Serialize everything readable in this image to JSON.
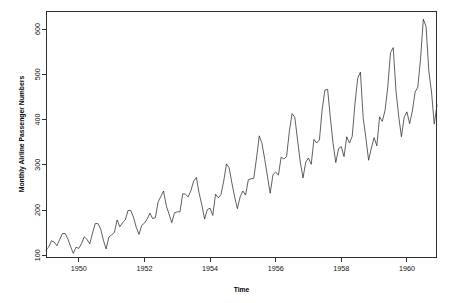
{
  "figure": {
    "background_color": "#ffffff",
    "foreground_color": "#1a1a1a",
    "line_color": "#2b2b2b",
    "width": 453,
    "height": 303
  },
  "axes": {
    "y_axis_title": "Monthly Airline Passenger Numbers",
    "x_axis_title": "Time",
    "y_ticks": [
      "100",
      "200",
      "300",
      "400",
      "500",
      "600"
    ],
    "x_ticks": [
      "1950",
      "1952",
      "1954",
      "1956",
      "1958",
      "1960"
    ]
  },
  "chart_data": {
    "type": "line",
    "title": "",
    "subtitle": "",
    "xlabel": "Time",
    "ylabel": "Monthly Airline Passenger Numbers",
    "xlim": [
      1949.0,
      1960.917
    ],
    "ylim": [
      95,
      640
    ],
    "xticks": [
      1950,
      1952,
      1954,
      1956,
      1958,
      1960
    ],
    "xticklabels": [
      "1950",
      "1952",
      "1954",
      "1956",
      "1958",
      "1960"
    ],
    "yticks": [
      100,
      200,
      300,
      400,
      500,
      600
    ],
    "yticklabels": [
      "100",
      "200",
      "300",
      "400",
      "500",
      "600"
    ],
    "grid": false,
    "legend": false,
    "legend_position": "none",
    "series": [
      {
        "name": "AirPassengers",
        "x": [
          1949.0,
          1949.083,
          1949.167,
          1949.25,
          1949.333,
          1949.417,
          1949.5,
          1949.583,
          1949.667,
          1949.75,
          1949.833,
          1949.917,
          1950.0,
          1950.083,
          1950.167,
          1950.25,
          1950.333,
          1950.417,
          1950.5,
          1950.583,
          1950.667,
          1950.75,
          1950.833,
          1950.917,
          1951.0,
          1951.083,
          1951.167,
          1951.25,
          1951.333,
          1951.417,
          1951.5,
          1951.583,
          1951.667,
          1951.75,
          1951.833,
          1951.917,
          1952.0,
          1952.083,
          1952.167,
          1952.25,
          1952.333,
          1952.417,
          1952.5,
          1952.583,
          1952.667,
          1952.75,
          1952.833,
          1952.917,
          1953.0,
          1953.083,
          1953.167,
          1953.25,
          1953.333,
          1953.417,
          1953.5,
          1953.583,
          1953.667,
          1953.75,
          1953.833,
          1953.917,
          1954.0,
          1954.083,
          1954.167,
          1954.25,
          1954.333,
          1954.417,
          1954.5,
          1954.583,
          1954.667,
          1954.75,
          1954.833,
          1954.917,
          1955.0,
          1955.083,
          1955.167,
          1955.25,
          1955.333,
          1955.417,
          1955.5,
          1955.583,
          1955.667,
          1955.75,
          1955.833,
          1955.917,
          1956.0,
          1956.083,
          1956.167,
          1956.25,
          1956.333,
          1956.417,
          1956.5,
          1956.583,
          1956.667,
          1956.75,
          1956.833,
          1956.917,
          1957.0,
          1957.083,
          1957.167,
          1957.25,
          1957.333,
          1957.417,
          1957.5,
          1957.583,
          1957.667,
          1957.75,
          1957.833,
          1957.917,
          1958.0,
          1958.083,
          1958.167,
          1958.25,
          1958.333,
          1958.417,
          1958.5,
          1958.583,
          1958.667,
          1958.75,
          1958.833,
          1958.917,
          1959.0,
          1959.083,
          1959.167,
          1959.25,
          1959.333,
          1959.417,
          1959.5,
          1959.583,
          1959.667,
          1959.75,
          1959.833,
          1959.917,
          1960.0,
          1960.083,
          1960.167,
          1960.25,
          1960.333,
          1960.417,
          1960.5,
          1960.583,
          1960.667,
          1960.75,
          1960.833,
          1960.917
        ],
        "values": [
          112,
          118,
          132,
          129,
          121,
          135,
          148,
          148,
          136,
          119,
          104,
          118,
          115,
          126,
          141,
          135,
          125,
          149,
          170,
          170,
          158,
          133,
          114,
          140,
          145,
          150,
          178,
          163,
          172,
          178,
          199,
          199,
          184,
          162,
          146,
          166,
          171,
          180,
          193,
          181,
          183,
          218,
          230,
          242,
          209,
          191,
          172,
          194,
          196,
          196,
          236,
          235,
          229,
          243,
          264,
          272,
          237,
          211,
          180,
          201,
          204,
          188,
          235,
          227,
          234,
          264,
          302,
          293,
          259,
          229,
          203,
          229,
          242,
          233,
          267,
          269,
          270,
          315,
          364,
          347,
          312,
          274,
          237,
          278,
          284,
          277,
          317,
          313,
          318,
          374,
          413,
          405,
          355,
          306,
          271,
          306,
          315,
          301,
          356,
          348,
          355,
          422,
          465,
          467,
          404,
          347,
          305,
          336,
          340,
          318,
          362,
          348,
          363,
          435,
          491,
          505,
          404,
          359,
          310,
          337,
          360,
          342,
          406,
          396,
          420,
          472,
          548,
          559,
          463,
          407,
          362,
          405,
          417,
          391,
          419,
          461,
          472,
          535,
          622,
          606,
          508,
          461,
          390,
          432
        ]
      }
    ]
  }
}
